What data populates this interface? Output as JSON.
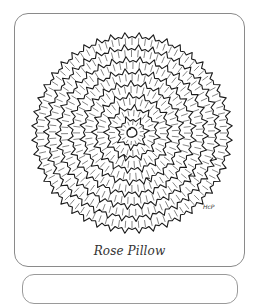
{
  "figure": {
    "caption": "Rose Pillow",
    "signature": "HcP",
    "illustration": "rose-pillow-line-drawing"
  },
  "colors": {
    "ink": "#1a1a1a",
    "frame": "#8a8a8a",
    "background": "#ffffff"
  }
}
